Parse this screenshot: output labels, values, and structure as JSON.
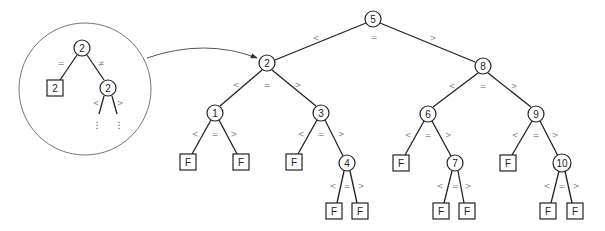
{
  "diagram": {
    "type": "ternary search tree",
    "nodes": [
      {
        "id": "n5",
        "label": "5",
        "shape": "circle",
        "x": 373,
        "y": 19
      },
      {
        "id": "n2",
        "label": "2",
        "shape": "circle",
        "x": 267,
        "y": 63
      },
      {
        "id": "n8",
        "label": "8",
        "shape": "circle",
        "x": 483,
        "y": 66
      },
      {
        "id": "n1",
        "label": "1",
        "shape": "circle",
        "x": 215,
        "y": 113
      },
      {
        "id": "n3",
        "label": "3",
        "shape": "circle",
        "x": 321,
        "y": 113
      },
      {
        "id": "n6",
        "label": "6",
        "shape": "circle",
        "x": 428,
        "y": 114
      },
      {
        "id": "n9",
        "label": "9",
        "shape": "circle",
        "x": 536,
        "y": 114
      },
      {
        "id": "n4",
        "label": "4",
        "shape": "circle",
        "x": 347,
        "y": 163
      },
      {
        "id": "n7",
        "label": "7",
        "shape": "circle",
        "x": 455,
        "y": 163
      },
      {
        "id": "n10",
        "label": "10",
        "shape": "circle",
        "x": 562,
        "y": 163
      },
      {
        "id": "f1l",
        "label": "F",
        "shape": "box",
        "x": 188,
        "y": 162
      },
      {
        "id": "f1r",
        "label": "F",
        "shape": "box",
        "x": 241,
        "y": 162
      },
      {
        "id": "f3l",
        "label": "F",
        "shape": "box",
        "x": 294,
        "y": 162
      },
      {
        "id": "f4l",
        "label": "F",
        "shape": "box",
        "x": 334,
        "y": 211
      },
      {
        "id": "f4r",
        "label": "F",
        "shape": "box",
        "x": 360,
        "y": 211
      },
      {
        "id": "f6l",
        "label": "F",
        "shape": "box",
        "x": 401,
        "y": 163
      },
      {
        "id": "f7l",
        "label": "F",
        "shape": "box",
        "x": 441,
        "y": 211
      },
      {
        "id": "f7r",
        "label": "F",
        "shape": "box",
        "x": 467,
        "y": 211
      },
      {
        "id": "f9l",
        "label": "F",
        "shape": "box",
        "x": 508,
        "y": 163
      },
      {
        "id": "f10l",
        "label": "F",
        "shape": "box",
        "x": 548,
        "y": 211
      },
      {
        "id": "f10r",
        "label": "F",
        "shape": "box",
        "x": 575,
        "y": 211
      }
    ],
    "edges": [
      {
        "from": "n5",
        "to": "n2"
      },
      {
        "from": "n5",
        "to": "n8"
      },
      {
        "from": "n2",
        "to": "n1"
      },
      {
        "from": "n2",
        "to": "n3"
      },
      {
        "from": "n8",
        "to": "n6"
      },
      {
        "from": "n8",
        "to": "n9"
      },
      {
        "from": "n1",
        "to": "f1l"
      },
      {
        "from": "n1",
        "to": "f1r"
      },
      {
        "from": "n3",
        "to": "f3l"
      },
      {
        "from": "n3",
        "to": "n4"
      },
      {
        "from": "n4",
        "to": "f4l"
      },
      {
        "from": "n4",
        "to": "f4r"
      },
      {
        "from": "n6",
        "to": "f6l"
      },
      {
        "from": "n6",
        "to": "n7"
      },
      {
        "from": "n7",
        "to": "f7l"
      },
      {
        "from": "n7",
        "to": "f7r"
      },
      {
        "from": "n9",
        "to": "f9l"
      },
      {
        "from": "n9",
        "to": "n10"
      },
      {
        "from": "n10",
        "to": "f10l"
      },
      {
        "from": "n10",
        "to": "f10r"
      }
    ],
    "edge_labels": [
      {
        "text": "<",
        "x": 316,
        "y": 38
      },
      {
        "text": "=",
        "x": 374,
        "y": 37
      },
      {
        "text": ">",
        "x": 433,
        "y": 38
      },
      {
        "text": "<",
        "x": 236,
        "y": 85
      },
      {
        "text": "=",
        "x": 267,
        "y": 85
      },
      {
        "text": ">",
        "x": 298,
        "y": 85
      },
      {
        "text": "<",
        "x": 452,
        "y": 86
      },
      {
        "text": "=",
        "x": 483,
        "y": 86
      },
      {
        "text": ">",
        "x": 514,
        "y": 86
      },
      {
        "text": "<",
        "x": 195,
        "y": 134
      },
      {
        "text": "=",
        "x": 215,
        "y": 134
      },
      {
        "text": ">",
        "x": 234,
        "y": 134
      },
      {
        "text": "<",
        "x": 301,
        "y": 134
      },
      {
        "text": "=",
        "x": 321,
        "y": 134
      },
      {
        "text": ">",
        "x": 341,
        "y": 134
      },
      {
        "text": "<",
        "x": 408,
        "y": 135
      },
      {
        "text": "=",
        "x": 428,
        "y": 135
      },
      {
        "text": ">",
        "x": 448,
        "y": 135
      },
      {
        "text": "<",
        "x": 515,
        "y": 135
      },
      {
        "text": "=",
        "x": 536,
        "y": 135
      },
      {
        "text": ">",
        "x": 555,
        "y": 135
      },
      {
        "text": "<",
        "x": 333,
        "y": 186
      },
      {
        "text": "=",
        "x": 347,
        "y": 186
      },
      {
        "text": ">",
        "x": 361,
        "y": 186
      },
      {
        "text": "<",
        "x": 440,
        "y": 186
      },
      {
        "text": "=",
        "x": 455,
        "y": 186
      },
      {
        "text": ">",
        "x": 468,
        "y": 186
      },
      {
        "text": "<",
        "x": 547,
        "y": 186
      },
      {
        "text": "=",
        "x": 562,
        "y": 186
      },
      {
        "text": ">",
        "x": 576,
        "y": 186
      }
    ],
    "inset": {
      "description": "magnified view of node 2",
      "circle": {
        "cx": 85,
        "cy": 89,
        "r": 66
      },
      "nodes": [
        {
          "id": "i2",
          "label": "2",
          "shape": "circle",
          "x": 82,
          "y": 48
        },
        {
          "id": "ibox",
          "label": "2",
          "shape": "box",
          "x": 55,
          "y": 88
        },
        {
          "id": "i2b",
          "label": "2",
          "shape": "circle",
          "x": 108,
          "y": 88
        }
      ],
      "edge_labels": [
        {
          "text": "=",
          "x": 61,
          "y": 63
        },
        {
          "text": "≠",
          "x": 101,
          "y": 63
        },
        {
          "text": "<",
          "x": 96,
          "y": 103
        },
        {
          "text": ">",
          "x": 120,
          "y": 103
        }
      ],
      "continuation": "⋮"
    }
  }
}
